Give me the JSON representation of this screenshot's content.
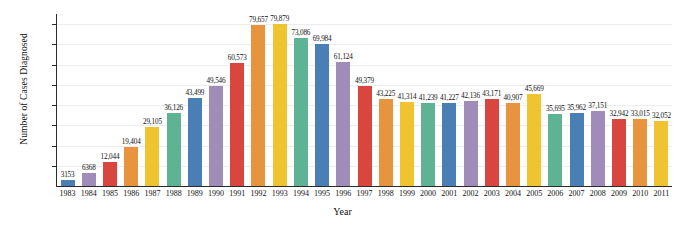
{
  "chart_data": {
    "type": "bar",
    "title": "",
    "xlabel": "Year",
    "ylabel": "Number of Cases Diagnosed",
    "ylim": [
      0,
      84000
    ],
    "grid": true,
    "legend": "none",
    "ytick_labels": [
      "80,000",
      "70,000",
      "60,000",
      "50,000",
      "40,000",
      "30,000",
      "20,000",
      "10,000"
    ],
    "ytick_values": [
      80000,
      70000,
      60000,
      50000,
      40000,
      30000,
      20000,
      10000
    ],
    "categories": [
      "1983",
      "1984",
      "1985",
      "1986",
      "1987",
      "1988",
      "1989",
      "1990",
      "1991",
      "1992",
      "1993",
      "1994",
      "1995",
      "1996",
      "1997",
      "1998",
      "1999",
      "2000",
      "2001",
      "2002",
      "2003",
      "2004",
      "2005",
      "2006",
      "2007",
      "2008",
      "2009",
      "2010",
      "2011"
    ],
    "values": [
      3153,
      6368,
      12044,
      19404,
      29105,
      36126,
      43499,
      49546,
      60573,
      79657,
      79879,
      73086,
      69984,
      61124,
      49379,
      43225,
      41314,
      41239,
      41227,
      42136,
      43171,
      40907,
      45669,
      35695,
      35962,
      37151,
      32942,
      33015,
      32052
    ],
    "value_labels": [
      "3153",
      "6368",
      "12,044",
      "19,404",
      "29,105",
      "36,126",
      "43,499",
      "49,546",
      "60,573",
      "79,657",
      "79,879",
      "73,086",
      "69,984",
      "61,124",
      "49,379",
      "43,225",
      "41,314",
      "41,239",
      "41,227",
      "42,136",
      "43,171",
      "40,907",
      "45,669",
      "35,695",
      "35,962",
      "37,151",
      "32,942",
      "33,015",
      "32,052"
    ],
    "bar_colors": [
      "#4a7fb5",
      "#a08cb8",
      "#d9453f",
      "#e8943f",
      "#f0c330",
      "#5fb395"
    ],
    "grid_color": "#ededf0",
    "axis_color": "#2b2b2b"
  }
}
